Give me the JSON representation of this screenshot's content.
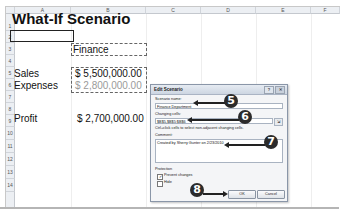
{
  "spreadsheet": {
    "columns": [
      "A",
      "B",
      "C",
      "D",
      "E",
      "F"
    ],
    "rows": [
      "1",
      "2",
      "3",
      "4",
      "5",
      "6",
      "7",
      "8",
      "9",
      "10",
      "11",
      "12",
      "13",
      "14"
    ],
    "title": "What-If Scenario",
    "cells": {
      "B3": "Finance",
      "A5": "Sales",
      "B5": "$ 5,500,000.00",
      "A6": "Expenses",
      "B6": "$ 2,800,000.00",
      "A8": "Profit",
      "B8": "$ 2,700,000.00"
    }
  },
  "dialog": {
    "title": "Edit Scenario",
    "help_label": "?",
    "close_label": "✕",
    "scenario_name_label": "Scenario name:",
    "scenario_name_value": "Finance Department",
    "changing_cells_label": "Changing cells:",
    "changing_cells_value": "$B$5,$B$5:$B$6",
    "changing_cells_hint": "Ctrl+click cells to select non-adjacent changing cells.",
    "comment_label": "Comment:",
    "comment_value": "Created by Sherry Gunter on 2/23/2010",
    "protection_label": "Protection",
    "prevent_changes_label": "Prevent changes",
    "prevent_changes_checked": true,
    "hide_label": "Hide",
    "hide_checked": false,
    "ok_label": "OK",
    "cancel_label": "Cancel"
  },
  "callouts": [
    "5",
    "6",
    "7",
    "8"
  ]
}
